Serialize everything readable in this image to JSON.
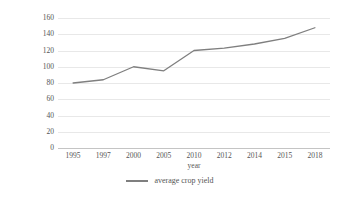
{
  "chart_data": {
    "type": "line",
    "title": "",
    "xlabel": "year",
    "ylabel": "average crop-paddy field",
    "categories": [
      "1995",
      "1997",
      "2000",
      "2005",
      "2010",
      "2012",
      "2014",
      "2015",
      "2018"
    ],
    "values": [
      80,
      84,
      100,
      95,
      120,
      123,
      128,
      135,
      148
    ],
    "series": [
      {
        "name": "average crop yield",
        "values": [
          80,
          84,
          100,
          95,
          120,
          123,
          128,
          135,
          148
        ],
        "color": "#7f7f7f"
      }
    ],
    "ylim": [
      0,
      160
    ],
    "yticks": [
      0,
      20,
      40,
      60,
      80,
      100,
      120,
      140,
      160
    ],
    "ytick_labels": [
      "0",
      "20",
      "40",
      "60",
      "80",
      "100",
      "120",
      "140",
      "160"
    ],
    "grid": "horizontal",
    "legend_position": "bottom",
    "legend_entries": [
      "average crop yield"
    ]
  },
  "legend": {
    "label": "average crop yield",
    "marker": "line-marker-icon"
  },
  "colors": {
    "line": "#7f7f7f",
    "gridline": "#e8e8e8",
    "axis": "#c4c4c4",
    "text": "#555555",
    "background": "#ffffff"
  }
}
